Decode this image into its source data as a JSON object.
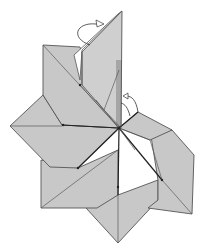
{
  "diagram": {
    "colors": {
      "paper": "#c8c8c8",
      "edge": "#555555",
      "dark_edge": "#222222",
      "background": "#ffffff"
    },
    "symbols": [
      {
        "name": "valley-fold-arrow-top",
        "type": "curved-arrow",
        "position": "top-left of tall flap"
      },
      {
        "name": "fold-arrow-right",
        "type": "curved-arrow",
        "position": "right of center vertical flap"
      }
    ]
  }
}
